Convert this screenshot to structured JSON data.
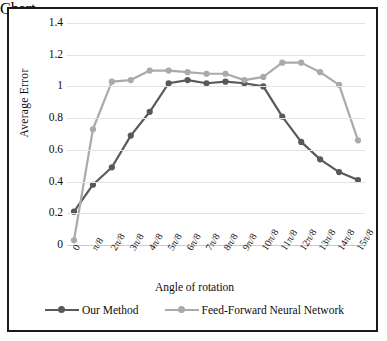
{
  "chart_data": {
    "type": "line",
    "title": "",
    "xlabel": "Angle of rotation",
    "ylabel": "Average Error",
    "categories": [
      "0",
      "π/8",
      "2π/8",
      "3π/8",
      "4π/8",
      "5π/8",
      "6π/8",
      "7π/8",
      "8π/8",
      "9π/8",
      "10π/8",
      "11π/8",
      "12π/8",
      "13π/8",
      "14π/8",
      "15π/8"
    ],
    "ylim": [
      0,
      1.4
    ],
    "yticks": [
      "0",
      "0.2",
      "0.4",
      "0.6",
      "0.8",
      "1",
      "1.2",
      "1.4"
    ],
    "ytick_values": [
      0,
      0.2,
      0.4,
      0.6,
      0.8,
      1.0,
      1.2,
      1.4
    ],
    "grid": true,
    "legend_position": "bottom",
    "series": [
      {
        "name": "Our Method",
        "color": "#595959",
        "values": [
          0.21,
          0.38,
          0.49,
          0.69,
          0.84,
          1.02,
          1.04,
          1.02,
          1.03,
          1.02,
          1.0,
          0.81,
          0.65,
          0.54,
          0.46,
          0.41
        ]
      },
      {
        "name": "Feed-Forward Neural Network",
        "color": "#aaaaaa",
        "values": [
          0.03,
          0.73,
          1.03,
          1.04,
          1.1,
          1.1,
          1.09,
          1.08,
          1.08,
          1.04,
          1.06,
          1.15,
          1.15,
          1.09,
          1.01,
          0.66
        ]
      }
    ]
  },
  "figure": {
    "border_color": "#1a1a1a",
    "background": "#ffffff",
    "gridline_color": "#e2e2e2"
  },
  "legend": {
    "items": [
      {
        "label": "Our Method",
        "color": "#595959"
      },
      {
        "label": "Feed-Forward Neural Network",
        "color": "#aaaaaa"
      }
    ]
  }
}
